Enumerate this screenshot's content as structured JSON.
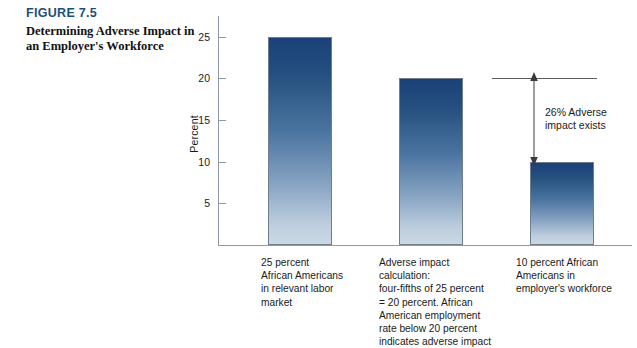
{
  "figure": {
    "number": "FIGURE 7.5",
    "title": "Determining Adverse Impact in an Employer's Workforce"
  },
  "colors": {
    "heading_blue": "#1f4e79",
    "bar_top": "#1b4178",
    "bar_bottom": "#ccd8e4",
    "axis_gray": "#8d99a6",
    "annotation_gray": "#5c5c5c"
  },
  "chart_data": {
    "type": "bar",
    "title": "Determining Adverse Impact in an Employer's Workforce",
    "xlabel": "",
    "ylabel": "Percent",
    "ylim": [
      0,
      27.5
    ],
    "yticks": [
      5,
      10,
      15,
      20,
      25
    ],
    "grid": false,
    "legend": "none",
    "categories": [
      "25 percent African Americans in relevant labor market",
      "Adverse impact calculation: four-fifths of 25 percent = 20 percent. African American employment rate below 20 percent indicates adverse impact",
      "10 percent African Americans in employer's workforce"
    ],
    "category_label_lines": [
      [
        "25 percent",
        "African Americans",
        "in relevant labor",
        "market"
      ],
      [
        "Adverse impact",
        "calculation:",
        "four-fifths of 25 percent",
        "= 20 percent.  African",
        "American employment",
        "rate below 20 percent",
        "indicates adverse impact"
      ],
      [
        "10 percent African",
        "Americans in",
        "employer's workforce"
      ]
    ],
    "values": [
      25,
      20,
      10
    ],
    "annotations": [
      {
        "text_lines": [
          "26% Adverse",
          "impact exists"
        ],
        "text": "26% Adverse impact exists",
        "type": "double-arrow",
        "from_value": 20,
        "to_value": 10,
        "reference_line_value": 20
      }
    ]
  }
}
